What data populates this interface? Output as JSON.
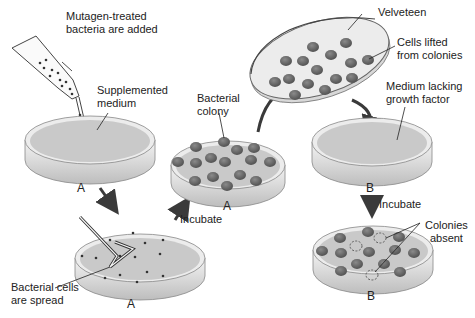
{
  "diagram": {
    "labels": {
      "mutagen": [
        "Mutagen-treated",
        "bacteria are added"
      ],
      "supplemented": [
        "Supplemented",
        "medium"
      ],
      "spread": [
        "Bacterial cells",
        "are spread"
      ],
      "colony": [
        "Bacterial",
        "colony"
      ],
      "incubate1": "Incubate",
      "velveteen": "Velveteen",
      "cells_lifted": [
        "Cells lifted",
        "from colonies"
      ],
      "medium_lacking": [
        "Medium lacking",
        "growth factor"
      ],
      "incubate2": "Incubate",
      "colonies_absent": [
        "Colonies",
        "absent"
      ]
    },
    "plates": [
      {
        "id": "plate-1",
        "letter": "A",
        "state": "supplemented medium"
      },
      {
        "id": "plate-2",
        "letter": "A",
        "state": "bacteria spread"
      },
      {
        "id": "plate-3",
        "letter": "A",
        "state": "colonies grown"
      },
      {
        "id": "velveteen-disc",
        "letter": "",
        "state": "cells lifted"
      },
      {
        "id": "plate-4",
        "letter": "B",
        "state": "medium lacking growth factor"
      },
      {
        "id": "plate-5",
        "letter": "B",
        "state": "colonies with some absent"
      }
    ],
    "colors": {
      "medium": "#c9c9c9",
      "colony": "#6a6a6a",
      "rim": "#e8e8e8",
      "arrow": "#3a3a3a"
    }
  }
}
